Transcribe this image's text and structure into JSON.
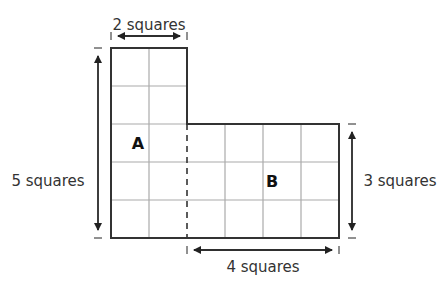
{
  "figure": {
    "grid": {
      "cell_px": 38,
      "origin": [
        111,
        48
      ]
    },
    "regions": [
      {
        "label": "A",
        "width_squares": 2,
        "height_squares": 5
      },
      {
        "label": "B",
        "width_squares": 4,
        "height_squares": 3
      }
    ],
    "dimensions": {
      "top": "2 squares",
      "left": "5 squares",
      "right": "3 squares",
      "bottom": "4 squares"
    },
    "colors": {
      "outline": "#333333",
      "grid": "#aaaaaa",
      "text": "#333333"
    }
  }
}
